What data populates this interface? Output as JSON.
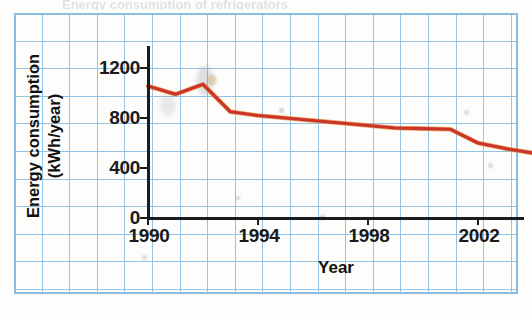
{
  "figure": {
    "top_cut_text": "Energy consumption of refrigerators",
    "xtitle": "Year",
    "ytitle_line1": "Energy consumption",
    "ytitle_line2": "(kWh/year)",
    "line_color": "#c9342b",
    "line_highlight_color": "#e8862c",
    "grid_color": "#6aaede",
    "axis_color": "#1b1b1b",
    "border_color": "#5ea3dc"
  },
  "axes": {
    "y_ticks": [
      "0",
      "400",
      "800",
      "1200"
    ],
    "y_tick_values": [
      0,
      400,
      800,
      1200
    ],
    "x_ticks": [
      "1990",
      "1994",
      "1998",
      "2002"
    ],
    "x_tick_values": [
      1990,
      1994,
      1998,
      2002
    ]
  },
  "chart_data": {
    "type": "line",
    "title": "",
    "xlabel": "Year",
    "ylabel": "Energy consumption (kWh/year)",
    "xlim": [
      1990,
      2004
    ],
    "ylim": [
      0,
      1400
    ],
    "xticks": [
      1990,
      1994,
      1998,
      2002
    ],
    "yticks": [
      0,
      400,
      800,
      1200
    ],
    "grid": true,
    "legend": "none",
    "series": [
      {
        "name": "Energy consumption",
        "color": "#c9342b",
        "x": [
          1990,
          1991,
          1992,
          1993,
          1994,
          1995,
          1996,
          1997,
          1998,
          1999,
          2000,
          2001,
          2002,
          2003,
          2004
        ],
        "values": [
          1055,
          990,
          1070,
          850,
          820,
          800,
          780,
          760,
          740,
          720,
          715,
          710,
          600,
          555,
          520
        ]
      }
    ]
  }
}
